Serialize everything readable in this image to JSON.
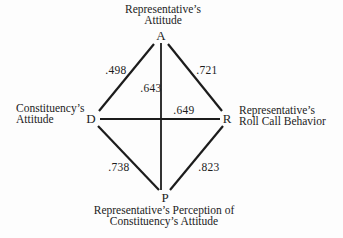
{
  "figure": {
    "background": "#fdfdfd",
    "ink": "#1c1c1c",
    "nodes": {
      "a": {
        "letter": "A",
        "label_line1": "Representative’s",
        "label_line2": "Attitude"
      },
      "d": {
        "letter": "D",
        "label_line1": "Constituency’s",
        "label_line2": "Attitude"
      },
      "r": {
        "letter": "R",
        "label_line1": "Representative’s",
        "label_line2": "Roll Call Behavior"
      },
      "p": {
        "letter": "P",
        "label_line1": "Representative’s Perception of",
        "label_line2": "Constituency’s Attitude"
      }
    },
    "edges": {
      "da": {
        "value": ".498"
      },
      "ar": {
        "value": ".721"
      },
      "ap": {
        "value": ".643"
      },
      "dr": {
        "value": ".649"
      },
      "dp": {
        "value": ".738"
      },
      "pr": {
        "value": ".823"
      }
    }
  }
}
